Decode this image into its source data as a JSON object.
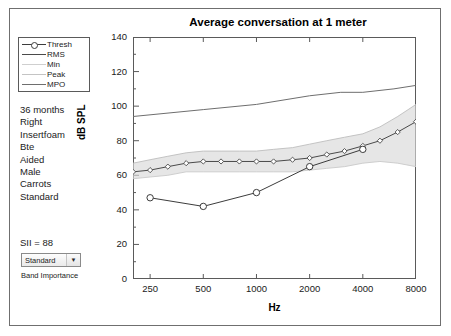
{
  "window": {
    "background_color": "#ffffff",
    "frame_color": "#6f6f6f"
  },
  "legend": {
    "items": [
      {
        "label": "Thresh",
        "color": "#3c3c3c",
        "marker": "circle"
      },
      {
        "label": "RMS",
        "color": "#4a4a4a",
        "marker": "none"
      },
      {
        "label": "Min",
        "color": "#c9c9c9",
        "marker": "none"
      },
      {
        "label": "Peak",
        "color": "#bdbdbd",
        "marker": "none"
      },
      {
        "label": "MPO",
        "color": "#6e6e6e",
        "marker": "none"
      }
    ]
  },
  "info": {
    "lines": [
      "36 months",
      "Right",
      "Insertfoam",
      "Bte",
      "Aided",
      "Male",
      "Carrots",
      "Standard"
    ]
  },
  "sii": {
    "text": "SII = 88"
  },
  "band_importance": {
    "selected": "Standard",
    "options": [
      "Standard"
    ],
    "label": "Band Importance",
    "arrow": "▼"
  },
  "chart_data": {
    "type": "line",
    "title": "Average conversation at 1 meter",
    "xlabel": "Hz",
    "ylabel": "dB SPL",
    "annotation": "60 dB SPL",
    "xscale": "log",
    "xlim": [
      200,
      8000
    ],
    "ylim": [
      0,
      140
    ],
    "xticks": [
      250,
      500,
      1000,
      2000,
      4000,
      8000
    ],
    "xtick_labels": [
      "250",
      "500",
      "1000",
      "2000",
      "4000",
      "8000"
    ],
    "yticks": [
      0,
      20,
      40,
      60,
      80,
      100,
      120,
      140
    ],
    "ytick_labels": [
      "0",
      "20",
      "40",
      "60",
      "80",
      "100",
      "120",
      "140"
    ],
    "yminor_step": 10,
    "grid": false,
    "legend_position": "outside-left",
    "series": [
      {
        "name": "Thresh",
        "marker": "circle",
        "color": "#3c3c3c",
        "x": [
          250,
          500,
          1000,
          2000,
          4000
        ],
        "values": [
          47,
          42,
          50,
          65,
          75
        ]
      },
      {
        "name": "RMS",
        "marker": "diamond",
        "color": "#4a4a4a",
        "x": [
          200,
          250,
          315,
          400,
          500,
          630,
          800,
          1000,
          1250,
          1600,
          2000,
          2500,
          3150,
          4000,
          5000,
          6300,
          8000
        ],
        "values": [
          62,
          63,
          65,
          67,
          68,
          68,
          68,
          68,
          68,
          69,
          70,
          72,
          74,
          77,
          80,
          85,
          91
        ]
      },
      {
        "name": "Peak",
        "marker": "none",
        "color": "#bdbdbd",
        "x": [
          200,
          250,
          315,
          400,
          500,
          630,
          800,
          1000,
          1250,
          1600,
          2000,
          2500,
          3150,
          4000,
          5000,
          6300,
          8000
        ],
        "values": [
          67,
          69,
          71,
          73,
          74,
          74,
          74,
          74,
          75,
          76,
          78,
          80,
          82,
          84,
          88,
          94,
          101
        ]
      },
      {
        "name": "Min",
        "marker": "none",
        "color": "#c9c9c9",
        "x": [
          200,
          250,
          315,
          400,
          500,
          630,
          800,
          1000,
          1250,
          1600,
          2000,
          2500,
          3150,
          4000,
          5000,
          6300,
          8000
        ],
        "values": [
          58,
          59,
          60,
          62,
          62,
          62,
          62,
          62,
          62,
          62,
          63,
          64,
          65,
          67,
          68,
          67,
          65
        ]
      },
      {
        "name": "MPO",
        "marker": "none",
        "color": "#6e6e6e",
        "x": [
          200,
          500,
          1000,
          2000,
          3000,
          4000,
          6000,
          8000
        ],
        "values": [
          94,
          98,
          101,
          106,
          108,
          108,
          110,
          112
        ]
      }
    ]
  }
}
